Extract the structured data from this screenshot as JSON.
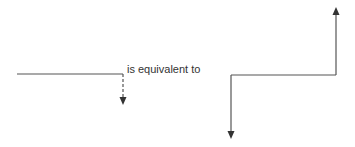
{
  "diagram": {
    "label": "is equivalent to",
    "left_figure": {
      "description": "horizontal line ending with dashed downward arrow",
      "line": {
        "x1": 17,
        "y1": 74,
        "x2": 123,
        "y2": 74
      },
      "dashed_arrow": {
        "x": 123,
        "y1": 74,
        "y2": 104
      }
    },
    "right_figure": {
      "description": "horizontal line with downward arrow at left end and upward arrow at right end",
      "horizontal": {
        "x1": 231,
        "y1": 75,
        "x2": 336,
        "y2": 75
      },
      "down_arrow": {
        "x": 231,
        "y1": 75,
        "y2": 138
      },
      "up_arrow": {
        "x": 336,
        "y1": 75,
        "y2": 8
      }
    },
    "stroke_color": "#555555"
  }
}
